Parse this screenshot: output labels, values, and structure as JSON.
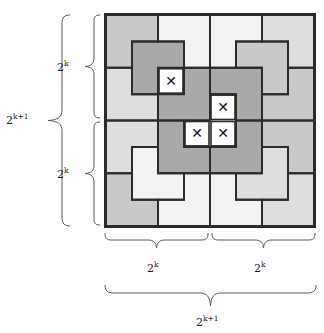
{
  "figure": {
    "type": "tromino-tiling-diagram",
    "caption_labels": {
      "left_outer": "2",
      "left_outer_sup": "k+1",
      "left_top": "2",
      "left_top_sup": "k",
      "left_bottom": "2",
      "left_bottom_sup": "k",
      "bottom_left": "2",
      "bottom_left_sup": "k",
      "bottom_right": "2",
      "bottom_right_sup": "k",
      "bottom_outer": "2",
      "bottom_outer_sup": "k+1"
    },
    "board": {
      "cols": 8,
      "rows": 8,
      "quadrant_cols": 4,
      "quadrant_rows": 4,
      "cell_px": 26.25
    },
    "colors": {
      "dark_gray": "#a9a9a9",
      "mid_gray": "#c9c9c9",
      "light_gray": "#dedede",
      "near_white": "#f2f2f2",
      "stroke": "#2b2b2b",
      "background": "#ffffff",
      "brace_stroke": "#5a5a5a"
    },
    "marks": {
      "symbol": "✕",
      "deficient_square": {
        "col": 2,
        "row": 2
      },
      "center_tromino": [
        {
          "col": 4,
          "row": 4
        },
        {
          "col": 3,
          "row": 4
        },
        {
          "col": 4,
          "row": 3
        }
      ]
    },
    "trominoes": [
      {
        "id": "q1-a",
        "shade": "dark_gray",
        "cells": [
          [
            0,
            0
          ],
          [
            1,
            0
          ],
          [
            0,
            1
          ]
        ]
      },
      {
        "id": "q1-b",
        "shade": "near_white",
        "cells": [
          [
            1,
            1
          ],
          [
            2,
            1
          ],
          [
            2,
            0
          ]
        ]
      },
      {
        "id": "q1-c",
        "shade": "light_gray",
        "cells": [
          [
            3,
            0
          ],
          [
            3,
            1
          ],
          [
            2,
            2
          ]
        ]
      },
      {
        "id": "q1-d",
        "shade": "dark_gray",
        "cells": [
          [
            0,
            2
          ],
          [
            0,
            3
          ],
          [
            1,
            3
          ]
        ]
      },
      {
        "id": "q1-e",
        "shade": "light_gray",
        "cells": [
          [
            1,
            2
          ],
          [
            2,
            3
          ],
          [
            3,
            3
          ]
        ]
      },
      {
        "id": "q1-f",
        "shade": "dark_gray",
        "cells": [
          [
            3,
            2
          ],
          [
            2,
            2
          ],
          [
            2,
            3
          ]
        ]
      },
      {
        "id": "q2-a",
        "shade": "dark_gray",
        "cells": [
          [
            4,
            0
          ],
          [
            5,
            0
          ],
          [
            4,
            1
          ]
        ]
      },
      {
        "id": "q2-b",
        "shade": "near_white",
        "cells": [
          [
            6,
            0
          ],
          [
            7,
            0
          ],
          [
            7,
            1
          ]
        ]
      },
      {
        "id": "q2-c",
        "shade": "light_gray",
        "cells": [
          [
            5,
            1
          ],
          [
            6,
            1
          ],
          [
            6,
            2
          ]
        ]
      },
      {
        "id": "q2-d",
        "shade": "near_white",
        "cells": [
          [
            4,
            2
          ],
          [
            4,
            3
          ],
          [
            5,
            3
          ]
        ]
      },
      {
        "id": "q2-e",
        "shade": "dark_gray",
        "cells": [
          [
            5,
            2
          ],
          [
            6,
            3
          ],
          [
            7,
            3
          ]
        ]
      },
      {
        "id": "q2-f",
        "shade": "light_gray",
        "cells": [
          [
            7,
            2
          ],
          [
            7,
            3
          ],
          [
            6,
            3
          ]
        ]
      },
      {
        "id": "q3-a",
        "shade": "dark_gray",
        "cells": [
          [
            0,
            4
          ],
          [
            1,
            4
          ],
          [
            0,
            5
          ]
        ]
      },
      {
        "id": "q3-b",
        "shade": "near_white",
        "cells": [
          [
            2,
            4
          ],
          [
            3,
            4
          ],
          [
            3,
            5
          ]
        ]
      },
      {
        "id": "q3-c",
        "shade": "light_gray",
        "cells": [
          [
            1,
            5
          ],
          [
            2,
            5
          ],
          [
            2,
            6
          ]
        ]
      },
      {
        "id": "q3-d",
        "shade": "dark_gray",
        "cells": [
          [
            0,
            6
          ],
          [
            0,
            7
          ],
          [
            1,
            7
          ]
        ]
      },
      {
        "id": "q3-e",
        "shade": "light_gray",
        "cells": [
          [
            1,
            6
          ],
          [
            2,
            7
          ],
          [
            3,
            7
          ]
        ]
      },
      {
        "id": "q3-f",
        "shade": "near_white",
        "cells": [
          [
            3,
            6
          ],
          [
            3,
            7
          ],
          [
            2,
            7
          ]
        ]
      },
      {
        "id": "q4-a",
        "shade": "light_gray",
        "cells": [
          [
            4,
            4
          ],
          [
            5,
            4
          ],
          [
            5,
            5
          ]
        ]
      },
      {
        "id": "q4-b",
        "shade": "dark_gray",
        "cells": [
          [
            6,
            4
          ],
          [
            7,
            4
          ],
          [
            7,
            5
          ]
        ]
      },
      {
        "id": "q4-c",
        "shade": "near_white",
        "cells": [
          [
            4,
            5
          ],
          [
            4,
            6
          ],
          [
            5,
            6
          ]
        ]
      },
      {
        "id": "q4-d",
        "shade": "light_gray",
        "cells": [
          [
            6,
            5
          ],
          [
            6,
            6
          ],
          [
            7,
            6
          ]
        ]
      },
      {
        "id": "q4-e",
        "shade": "dark_gray",
        "cells": [
          [
            4,
            7
          ],
          [
            5,
            7
          ],
          [
            5,
            6
          ]
        ]
      },
      {
        "id": "q4-f",
        "shade": "near_white",
        "cells": [
          [
            6,
            7
          ],
          [
            7,
            7
          ],
          [
            7,
            6
          ]
        ]
      }
    ]
  }
}
